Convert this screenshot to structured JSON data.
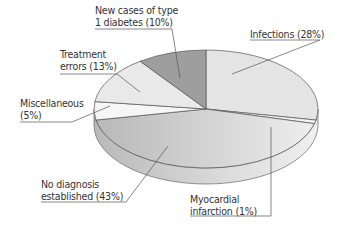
{
  "chart_data": {
    "type": "pie",
    "style": "3d",
    "title": "",
    "categories": [
      "Infections",
      "Myocardial infarction",
      "No diagnosis established",
      "Miscellaneous",
      "Treatment errors",
      "New cases of type 1 diabetes"
    ],
    "values": [
      28,
      1,
      43,
      5,
      13,
      10
    ],
    "unit": "%",
    "colors": [
      "#e4e4e4",
      "#f2f2f2",
      "#c2c2c2",
      "#f6f6f6",
      "#e9e9e9",
      "#9e9e9e"
    ],
    "labels": [
      {
        "line1": "Infections (28%)",
        "line2": ""
      },
      {
        "line1": "Myocardial",
        "line2": "infarction (1%)"
      },
      {
        "line1": "No diagnosis",
        "line2": "established (43%)"
      },
      {
        "line1": "Miscellaneous",
        "line2": "(5%)"
      },
      {
        "line1": "Treatment",
        "line2": "errors (13%)"
      },
      {
        "line1": "New cases of type",
        "line2": "1 diabetes (10%)"
      }
    ],
    "legend": "none (callout labels)"
  }
}
